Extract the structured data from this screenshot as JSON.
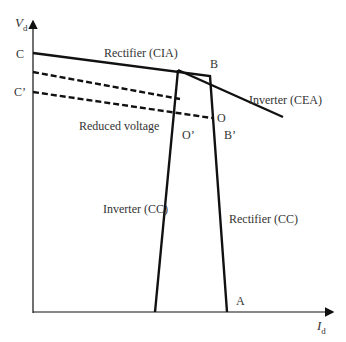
{
  "diagram": {
    "axes": {
      "y_label": "V",
      "y_sub": "d",
      "x_label": "I",
      "x_sub": "d"
    },
    "points": {
      "C": "C",
      "C_prime": "C’",
      "B": "B",
      "B_prime": "B’",
      "O": "O",
      "O_prime": "O’",
      "A": "A"
    },
    "curves": {
      "rectifier_cia": "Rectifier (CIA)",
      "inverter_cea": "Inverter (CEA)",
      "reduced_voltage": "Reduced voltage",
      "inverter_cc": "Inverter (CC)",
      "rectifier_cc": "Rectifier (CC)"
    },
    "colors": {
      "line": "#111111",
      "text": "#333333"
    }
  }
}
